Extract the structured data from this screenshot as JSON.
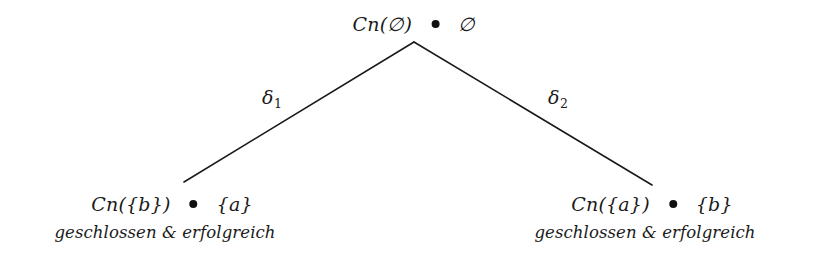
{
  "diagram": {
    "type": "remainder-set-tree",
    "background_color": "#ffffff",
    "ink_color": "#1a1a1a",
    "root": {
      "left_expr": "Cn(∅)",
      "marker": "•",
      "right_expr": "∅"
    },
    "edges": [
      {
        "id": "left",
        "label_base": "δ",
        "label_sub": "1",
        "from": "root",
        "to": "leaf-left"
      },
      {
        "id": "right",
        "label_base": "δ",
        "label_sub": "2",
        "from": "root",
        "to": "leaf-right"
      }
    ],
    "leaves": [
      {
        "id": "leaf-left",
        "left_expr": "Cn({b})",
        "marker": "•",
        "right_expr": "{a}",
        "caption": "geschlossen & erfolgreich"
      },
      {
        "id": "leaf-right",
        "left_expr": "Cn({a})",
        "marker": "•",
        "right_expr": "{b}",
        "caption": "geschlossen & erfolgreich"
      }
    ]
  }
}
